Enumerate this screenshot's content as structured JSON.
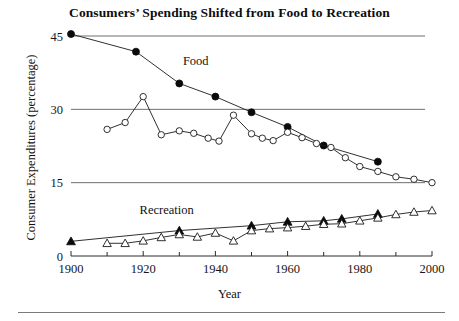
{
  "chart_data": {
    "type": "line",
    "title": "Consumers’ Spending Shifted from Food to Recreation",
    "xlabel": "Year",
    "ylabel": "Consumer Expenditures (percentage)",
    "xlim": [
      1900,
      2000
    ],
    "ylim": [
      0,
      45
    ],
    "yticks": [
      0,
      15,
      30,
      45
    ],
    "xticks": [
      1900,
      1920,
      1940,
      1960,
      1980,
      2000
    ],
    "xtick_labels": [
      "1900",
      "1920",
      "1940",
      "1960",
      "1980",
      "2000"
    ],
    "ytick_labels": [
      "0",
      "15",
      "30",
      "45"
    ],
    "xminor_ticks": [
      1910,
      1930,
      1950,
      1970,
      1990
    ],
    "grid": "horizontal",
    "legend": "inline-annotations",
    "annotations": [
      {
        "text": "Food",
        "x": 1931,
        "y": 39.0
      },
      {
        "text": "Recreation",
        "x": 1919,
        "y": 8.6
      }
    ],
    "series": [
      {
        "name": "Food (benchmark years)",
        "marker": "filled-circle",
        "points": [
          {
            "x": 1900,
            "y": 45.4
          },
          {
            "x": 1918,
            "y": 41.8
          },
          {
            "x": 1930,
            "y": 35.3
          },
          {
            "x": 1940,
            "y": 32.6
          },
          {
            "x": 1950,
            "y": 29.4
          },
          {
            "x": 1960,
            "y": 26.4
          },
          {
            "x": 1970,
            "y": 22.6
          },
          {
            "x": 1985,
            "y": 19.3
          }
        ]
      },
      {
        "name": "Food (annual)",
        "marker": "open-circle",
        "points": [
          {
            "x": 1910,
            "y": 25.9
          },
          {
            "x": 1915,
            "y": 27.3
          },
          {
            "x": 1920,
            "y": 32.6
          },
          {
            "x": 1925,
            "y": 24.8
          },
          {
            "x": 1930,
            "y": 25.6
          },
          {
            "x": 1934,
            "y": 25.1
          },
          {
            "x": 1938,
            "y": 24.1
          },
          {
            "x": 1941,
            "y": 23.5
          },
          {
            "x": 1945,
            "y": 28.8
          },
          {
            "x": 1950,
            "y": 25.0
          },
          {
            "x": 1953,
            "y": 24.1
          },
          {
            "x": 1956,
            "y": 23.6
          },
          {
            "x": 1960,
            "y": 25.3
          },
          {
            "x": 1964,
            "y": 24.2
          },
          {
            "x": 1968,
            "y": 23.0
          },
          {
            "x": 1972,
            "y": 22.2
          },
          {
            "x": 1976,
            "y": 20.1
          },
          {
            "x": 1980,
            "y": 18.3
          },
          {
            "x": 1985,
            "y": 17.3
          },
          {
            "x": 1990,
            "y": 16.2
          },
          {
            "x": 1995,
            "y": 15.7
          },
          {
            "x": 2000,
            "y": 15.0
          }
        ]
      },
      {
        "name": "Recreation (benchmark years)",
        "marker": "filled-triangle",
        "points": [
          {
            "x": 1900,
            "y": 3.0
          },
          {
            "x": 1930,
            "y": 5.2
          },
          {
            "x": 1950,
            "y": 6.2
          },
          {
            "x": 1960,
            "y": 7.0
          },
          {
            "x": 1970,
            "y": 7.2
          },
          {
            "x": 1975,
            "y": 7.6
          },
          {
            "x": 1985,
            "y": 8.6
          }
        ]
      },
      {
        "name": "Recreation (annual)",
        "marker": "open-triangle",
        "points": [
          {
            "x": 1910,
            "y": 2.6
          },
          {
            "x": 1915,
            "y": 2.6
          },
          {
            "x": 1920,
            "y": 3.1
          },
          {
            "x": 1925,
            "y": 3.8
          },
          {
            "x": 1930,
            "y": 4.4
          },
          {
            "x": 1935,
            "y": 3.9
          },
          {
            "x": 1940,
            "y": 4.7
          },
          {
            "x": 1945,
            "y": 3.1
          },
          {
            "x": 1950,
            "y": 5.2
          },
          {
            "x": 1955,
            "y": 5.6
          },
          {
            "x": 1960,
            "y": 5.8
          },
          {
            "x": 1965,
            "y": 6.1
          },
          {
            "x": 1970,
            "y": 6.5
          },
          {
            "x": 1975,
            "y": 6.6
          },
          {
            "x": 1980,
            "y": 7.2
          },
          {
            "x": 1985,
            "y": 7.8
          },
          {
            "x": 1990,
            "y": 8.5
          },
          {
            "x": 1995,
            "y": 9.0
          },
          {
            "x": 2000,
            "y": 9.3
          }
        ]
      }
    ]
  },
  "figure": {
    "title": "Consumers’ Spending Shifted from Food to Recreation",
    "y_axis_title": "Consumer Expenditures (percentage)",
    "x_axis_title": "Year"
  }
}
